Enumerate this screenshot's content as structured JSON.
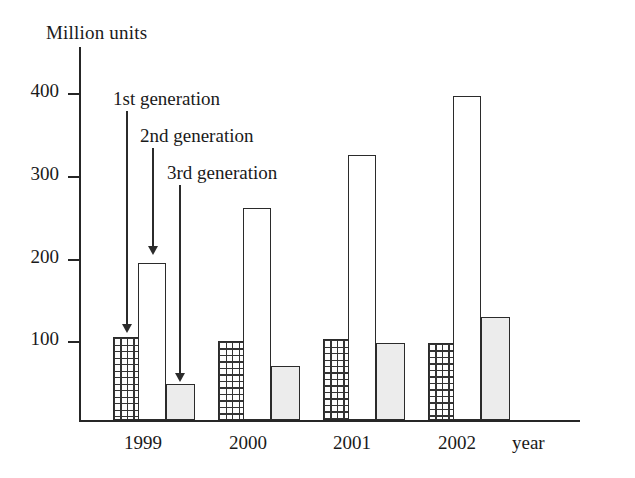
{
  "chart_data": {
    "type": "bar",
    "title": "",
    "xlabel": "year",
    "ylabel": "Million units",
    "categories": [
      "1999",
      "2000",
      "2001",
      "2002"
    ],
    "ylim": [
      0,
      440
    ],
    "yticks": [
      100,
      200,
      300,
      400
    ],
    "ytick_labels": [
      "100",
      "200",
      "300",
      "400"
    ],
    "grid": false,
    "legend_position": "inline-annotations",
    "series": [
      {
        "name": "1st generation",
        "fill": "cross-hatch-grid",
        "values": [
          105,
          100,
          102,
          98
        ]
      },
      {
        "name": "2nd generation",
        "fill": "white-outline",
        "values": [
          199,
          268,
          336,
          410
        ]
      },
      {
        "name": "3rd generation",
        "fill": "light-gray",
        "values": [
          46,
          69,
          97,
          131
        ]
      }
    ],
    "annotations": [
      {
        "text": "1st generation",
        "points_to_series": "1st generation",
        "points_to_category": "1999"
      },
      {
        "text": "2nd generation",
        "points_to_series": "2nd generation",
        "points_to_category": "1999"
      },
      {
        "text": "3rd generation",
        "points_to_series": "3rd generation",
        "points_to_category": "1999"
      }
    ],
    "colors": {
      "axis": "#262626",
      "bar_outline": "#2b2b2b",
      "gen1_fill": "#fdfdfd",
      "gen2_fill": "#ffffff",
      "gen3_fill": "#ececec",
      "background": "#ffffff"
    }
  },
  "axes": {
    "y_title": "Million units",
    "x_title": "year",
    "y_tick_labels": [
      "400",
      "300",
      "200",
      "100"
    ],
    "x_tick_labels": [
      "1999",
      "2000",
      "2001",
      "2002"
    ]
  },
  "annotations": {
    "gen1": "1st generation",
    "gen2": "2nd generation",
    "gen3": "3rd generation"
  }
}
